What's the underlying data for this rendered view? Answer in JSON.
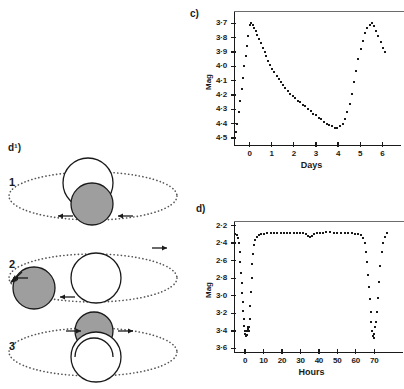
{
  "figure": {
    "panels": {
      "diagram_label": "d¹)",
      "chart_c_label": "c)",
      "chart_d_label": "d)"
    }
  },
  "diagram": {
    "name": "eclipsing-binary-orbit-stages",
    "stages": [
      {
        "number": "1",
        "description": "secondary star in front, arrows pointing inward",
        "white_star": {
          "cx": 88,
          "cy": 183,
          "r": 25
        },
        "gray_star": {
          "cx": 92,
          "cy": 204,
          "r": 21
        },
        "orbit": {
          "cx": 93,
          "cy": 196,
          "rx": 84,
          "ry": 24
        },
        "arrows": [
          {
            "x": 58,
            "y": 216,
            "dir": "left"
          },
          {
            "x": 118,
            "y": 216,
            "dir": "left"
          }
        ]
      },
      {
        "number": "2",
        "description": "secondary star at left elongation, arrows pointing left",
        "white_star": {
          "cx": 96,
          "cy": 278,
          "r": 25
        },
        "gray_star": {
          "cx": 34,
          "cy": 288,
          "r": 21
        },
        "orbit": {
          "cx": 93,
          "cy": 278,
          "rx": 84,
          "ry": 24
        },
        "arrows": [
          {
            "x": 13,
            "y": 278,
            "dir": "left"
          },
          {
            "x": 60,
            "y": 297,
            "dir": "left"
          },
          {
            "x": 152,
            "y": 248,
            "dir": "right"
          }
        ]
      },
      {
        "number": "3",
        "description": "secondary star behind primary, arrows pointing outward",
        "white_star": {
          "cx": 96,
          "cy": 357,
          "r": 25
        },
        "gray_star": {
          "cx": 94,
          "cy": 331,
          "r": 19
        },
        "orbit": {
          "cx": 93,
          "cy": 352,
          "rx": 84,
          "ry": 24
        },
        "arrows": [
          {
            "x": 66,
            "y": 331,
            "dir": "right"
          },
          {
            "x": 118,
            "y": 331,
            "dir": "right"
          }
        ]
      }
    ],
    "colors": {
      "primary_star_fill": "#ffffff",
      "secondary_star_fill": "#9e9e9e",
      "outline": "#1a1a1a",
      "orbit_dotted": "#555555"
    }
  },
  "chart_data": [
    {
      "id": "chart-c",
      "type": "scatter",
      "label": "c)",
      "title": "",
      "xlabel": "Days",
      "ylabel": "Mag",
      "x_ticks": [
        0,
        1,
        2,
        3,
        4,
        5,
        6
      ],
      "x_tick_labels": [
        "0",
        "1",
        "2",
        "3",
        "4",
        "5",
        "6"
      ],
      "y_ticks": [
        3.7,
        3.8,
        3.9,
        4.0,
        4.1,
        4.2,
        4.3,
        4.4,
        4.5
      ],
      "y_tick_labels": [
        "3·7",
        "3·8",
        "3·9",
        "4·0",
        "4·1",
        "4·2",
        "4·3",
        "4·4",
        "4·5"
      ],
      "xlim": [
        -0.7,
        6.3
      ],
      "ylim": [
        4.55,
        3.62
      ],
      "y_inverted": true,
      "grid": false,
      "x": [
        -0.62,
        -0.55,
        -0.48,
        -0.42,
        -0.36,
        -0.3,
        -0.24,
        -0.18,
        -0.12,
        -0.06,
        0.0,
        0.07,
        0.14,
        0.21,
        0.28,
        0.36,
        0.44,
        0.52,
        0.6,
        0.68,
        0.76,
        0.85,
        0.94,
        1.03,
        1.12,
        1.22,
        1.32,
        1.42,
        1.52,
        1.62,
        1.73,
        1.84,
        1.95,
        2.06,
        2.17,
        2.28,
        2.4,
        2.52,
        2.64,
        2.76,
        2.88,
        3.0,
        3.12,
        3.24,
        3.36,
        3.48,
        3.6,
        3.72,
        3.84,
        3.96,
        4.08,
        4.2,
        4.32,
        4.42,
        4.52,
        4.62,
        4.72,
        4.82,
        4.92,
        5.02,
        5.12,
        5.22,
        5.32,
        5.42,
        5.52,
        5.62,
        5.72,
        5.82,
        5.92,
        6.02,
        6.12
      ],
      "y": [
        4.46,
        4.4,
        4.32,
        4.24,
        4.16,
        4.08,
        4.0,
        3.93,
        3.86,
        3.79,
        3.71,
        3.7,
        3.71,
        3.73,
        3.75,
        3.78,
        3.81,
        3.84,
        3.87,
        3.9,
        3.93,
        3.96,
        3.99,
        4.02,
        4.04,
        4.07,
        4.09,
        4.11,
        4.13,
        4.15,
        4.17,
        4.19,
        4.21,
        4.22,
        4.24,
        4.25,
        4.27,
        4.28,
        4.3,
        4.31,
        4.33,
        4.34,
        4.36,
        4.37,
        4.39,
        4.4,
        4.41,
        4.42,
        4.43,
        4.43,
        4.42,
        4.4,
        4.37,
        4.32,
        4.26,
        4.19,
        4.11,
        4.03,
        3.95,
        3.88,
        3.82,
        3.77,
        3.73,
        3.71,
        3.7,
        3.72,
        3.75,
        3.79,
        3.83,
        3.87,
        3.9
      ]
    },
    {
      "id": "chart-d",
      "type": "scatter",
      "label": "d)",
      "title": "",
      "xlabel": "Hours",
      "ylabel": "Mag",
      "x_ticks": [
        0,
        10,
        20,
        30,
        40,
        50,
        60,
        70
      ],
      "x_tick_labels": [
        "0",
        "10",
        "20",
        "30",
        "40",
        "50",
        "60",
        "70"
      ],
      "y_ticks": [
        2.2,
        2.4,
        2.6,
        2.8,
        3.0,
        3.2,
        3.4,
        3.6
      ],
      "y_tick_labels": [
        "2·2",
        "2·4",
        "2·6",
        "2·8",
        "3·0",
        "3·2",
        "3·4",
        "3·6"
      ],
      "xlim": [
        -6,
        78
      ],
      "ylim": [
        3.64,
        2.16
      ],
      "y_inverted": true,
      "grid": false,
      "x": [
        -5.2,
        -4.4,
        -3.8,
        -3.4,
        -3.0,
        -2.6,
        -2.2,
        -1.9,
        -1.6,
        -1.3,
        -1.0,
        -0.7,
        -0.4,
        -0.1,
        0.2,
        0.5,
        0.8,
        1.1,
        1.4,
        1.7,
        2.0,
        2.3,
        2.6,
        2.9,
        3.2,
        3.5,
        3.9,
        4.3,
        4.8,
        5.4,
        6.2,
        7.4,
        8.8,
        10.4,
        12.0,
        13.8,
        15.6,
        17.4,
        19.2,
        21.0,
        22.8,
        24.6,
        26.4,
        28.2,
        30.0,
        31.5,
        33.0,
        34.2,
        35.2,
        36.2,
        37.4,
        38.8,
        40.4,
        42.2,
        44.0,
        46.0,
        48.0,
        50.0,
        52.0,
        54.0,
        56.0,
        58.0,
        59.8,
        61.4,
        62.8,
        63.9,
        64.8,
        65.5,
        66.1,
        66.7,
        67.2,
        67.7,
        68.1,
        68.5,
        68.9,
        69.3,
        69.7,
        70.1,
        70.5,
        70.9,
        71.4,
        71.9,
        72.5,
        73.2,
        74.0,
        74.9,
        75.9,
        77.0
      ],
      "y": [
        2.3,
        2.31,
        2.34,
        2.4,
        2.5,
        2.62,
        2.74,
        2.86,
        2.97,
        3.07,
        3.17,
        3.26,
        3.34,
        3.4,
        3.44,
        3.46,
        3.45,
        3.4,
        3.36,
        3.38,
        3.4,
        3.36,
        3.26,
        3.12,
        2.96,
        2.8,
        2.64,
        2.52,
        2.42,
        2.36,
        2.33,
        2.31,
        2.3,
        2.3,
        2.29,
        2.29,
        2.29,
        2.29,
        2.28,
        2.28,
        2.28,
        2.28,
        2.28,
        2.28,
        2.28,
        2.29,
        2.3,
        2.32,
        2.33,
        2.32,
        2.3,
        2.29,
        2.28,
        2.28,
        2.27,
        2.27,
        2.28,
        2.28,
        2.28,
        2.28,
        2.29,
        2.29,
        2.3,
        2.3,
        2.31,
        2.34,
        2.4,
        2.5,
        2.62,
        2.76,
        2.9,
        3.04,
        3.18,
        3.3,
        3.4,
        3.46,
        3.48,
        3.44,
        3.36,
        3.3,
        3.18,
        3.02,
        2.84,
        2.66,
        2.5,
        2.4,
        2.33,
        2.29
      ]
    }
  ]
}
